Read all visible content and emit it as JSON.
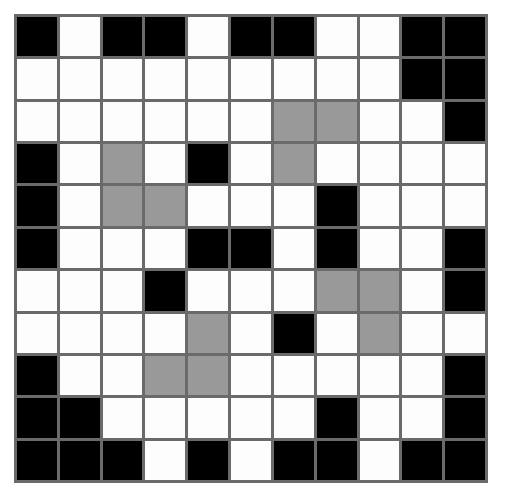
{
  "figure": {
    "type": "grid-pattern",
    "rows": 11,
    "columns": 11,
    "cell_size_px": 40,
    "gridline_width_px": 3,
    "palette": {
      "black": "#000000",
      "white": "#fdfdfd",
      "gray": "#999999",
      "gridline": "#6a6a6a",
      "background": "#ffffff"
    },
    "legend": {
      "K": "black",
      "W": "white",
      "G": "gray"
    },
    "cells": [
      [
        "K",
        "W",
        "K",
        "K",
        "W",
        "K",
        "K",
        "W",
        "W",
        "K",
        "K"
      ],
      [
        "W",
        "W",
        "W",
        "W",
        "W",
        "W",
        "W",
        "W",
        "W",
        "K",
        "K"
      ],
      [
        "W",
        "W",
        "W",
        "W",
        "W",
        "W",
        "G",
        "G",
        "W",
        "W",
        "K"
      ],
      [
        "K",
        "W",
        "G",
        "W",
        "K",
        "W",
        "G",
        "W",
        "W",
        "W",
        "W"
      ],
      [
        "K",
        "W",
        "G",
        "G",
        "W",
        "W",
        "W",
        "K",
        "W",
        "W",
        "W"
      ],
      [
        "K",
        "W",
        "W",
        "W",
        "K",
        "K",
        "W",
        "K",
        "W",
        "W",
        "K"
      ],
      [
        "W",
        "W",
        "W",
        "K",
        "W",
        "W",
        "W",
        "G",
        "G",
        "W",
        "K"
      ],
      [
        "W",
        "W",
        "W",
        "W",
        "G",
        "W",
        "K",
        "W",
        "G",
        "W",
        "W"
      ],
      [
        "K",
        "W",
        "W",
        "G",
        "G",
        "W",
        "W",
        "W",
        "W",
        "W",
        "K"
      ],
      [
        "K",
        "K",
        "W",
        "W",
        "W",
        "W",
        "W",
        "K",
        "W",
        "W",
        "K"
      ],
      [
        "K",
        "K",
        "K",
        "W",
        "K",
        "W",
        "K",
        "K",
        "W",
        "K",
        "K"
      ]
    ],
    "counts": {
      "black": 41,
      "white": 69,
      "gray": 11,
      "total": 121
    }
  }
}
